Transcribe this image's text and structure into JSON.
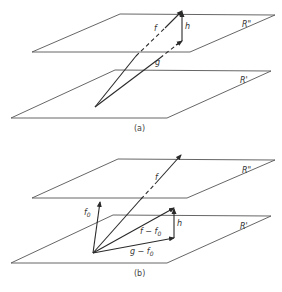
{
  "figure": {
    "panel_a": {
      "caption": "(a)",
      "upper_plane_label": "R\"",
      "lower_plane_label": "R'",
      "vectors": {
        "f_label": "f",
        "g_label": "g",
        "h_label": "h"
      }
    },
    "panel_b": {
      "caption": "(b)",
      "upper_plane_label": "R\"",
      "lower_plane_label": "R'",
      "vectors": {
        "f_label": "f",
        "f0_label": "f",
        "f0_sub": "0",
        "f_minus_f0_label": "f − f",
        "f_minus_f0_sub": "0",
        "g_minus_f0_label": "g − f",
        "g_minus_f0_sub": "0",
        "h_label": "h"
      }
    }
  }
}
